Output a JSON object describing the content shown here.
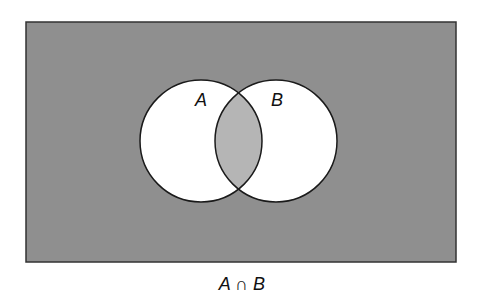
{
  "diagram": {
    "type": "venn",
    "universe": {
      "x": 26,
      "y": 22,
      "width": 430,
      "height": 240,
      "fill": "#8f8f8f",
      "stroke": "#333333",
      "shaded": true
    },
    "sets": [
      {
        "id": "A",
        "label": "A",
        "cx": 201,
        "cy": 141,
        "r": 61,
        "fill": "#ffffff",
        "label_x": 201,
        "label_y": 106
      },
      {
        "id": "B",
        "label": "B",
        "cx": 276,
        "cy": 141,
        "r": 61,
        "fill": "#ffffff",
        "label_x": 277,
        "label_y": 106
      }
    ],
    "intersection": {
      "label": "A ∩ B",
      "fill": "#b5b5b5",
      "shaded": true
    },
    "stroke_color": "#1a1a1a",
    "caption": "A ∩ B"
  }
}
